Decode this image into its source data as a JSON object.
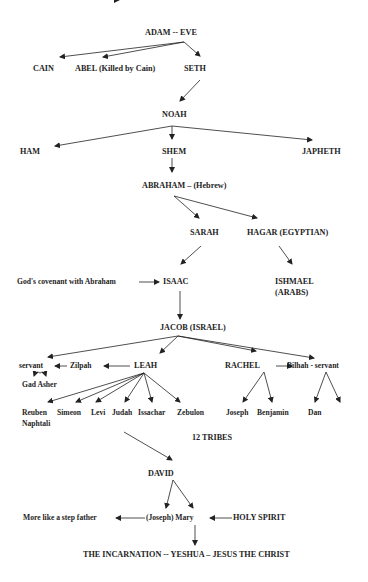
{
  "diagram": {
    "colors": {
      "text": "#1e1e1e",
      "line": "#222222",
      "background": "#ffffff"
    },
    "nodes": {
      "adam_eve": "ADAM -- EVE",
      "cain": "CAIN",
      "abel": "ABEL (Killed by Cain)",
      "seth": "SETH",
      "noah": "NOAH",
      "ham": "HAM",
      "shem": "SHEM",
      "japheth": "JAPHETH",
      "abraham": "ABRAHAM – (Hebrew)",
      "sarah": "SARAH",
      "hagar": "HAGAR (EGYPTIAN)",
      "covenant": "God's covenant with Abraham",
      "isaac": "ISAAC",
      "ishmael_1": "ISHMAEL",
      "ishmael_2": "(ARABS)",
      "jacob": "JACOB (ISRAEL)",
      "servant_left": "servant",
      "zilpah": "Zilpah",
      "leah": "LEAH",
      "rachel": "RACHEL",
      "bilhah": "Bilhah - servant",
      "gad_asher": "Gad Asher",
      "reuben": "Reuben",
      "naphtali": "Naphtali",
      "simeon": "Simeon",
      "levi": "Levi",
      "judah": "Judah",
      "issachar": "Issachar",
      "zebulon": "Zebulon",
      "joseph_son": "Joseph",
      "benjamin": "Benjamin",
      "dan": "Dan",
      "twelve_tribes": "12 TRIBES",
      "david": "DAVID",
      "step_father": "More like a step father",
      "joseph_mary": "(Joseph) Mary",
      "holy_spirit": "HOLY SPIRIT",
      "incarnation": "THE INCARNATION -- YESHUA – JESUS THE CHRIST"
    }
  }
}
